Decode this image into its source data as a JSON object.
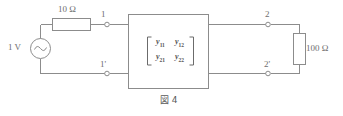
{
  "figure": {
    "caption": "図 4",
    "background_color": "#ffffff",
    "line_color": "#8c8c8c",
    "text_color": "#6e6e6e"
  },
  "source": {
    "label": "1 V",
    "type": "ac-voltage-source",
    "symbol": "sine-wave"
  },
  "components": {
    "series_resistor": {
      "label": "10 Ω",
      "value": "10",
      "unit": "Ω",
      "orientation": "horizontal"
    },
    "load_resistor": {
      "label": "100 Ω",
      "value": "100",
      "unit": "Ω",
      "orientation": "vertical"
    }
  },
  "terminals": {
    "input_top": "1",
    "input_bottom": "1'",
    "output_top": "2",
    "output_bottom": "2'"
  },
  "two_port": {
    "type": "y-parameter-matrix",
    "bracket": "square",
    "matrix": [
      [
        "y11",
        "y12"
      ],
      [
        "y21",
        "y22"
      ]
    ],
    "matrix_display": [
      [
        {
          "base": "y",
          "sub": "11"
        },
        {
          "base": "y",
          "sub": "12"
        }
      ],
      [
        {
          "base": "y",
          "sub": "21"
        },
        {
          "base": "y",
          "sub": "22"
        }
      ]
    ]
  }
}
